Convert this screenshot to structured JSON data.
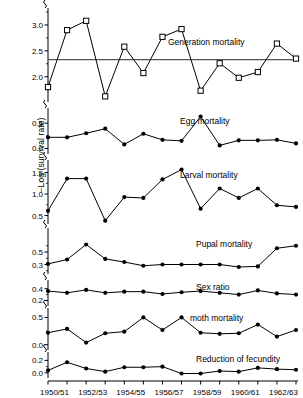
{
  "figure": {
    "y_axis_title": "−Log (survival rate)",
    "x_tick_labels": [
      "1950/51",
      "1952/53",
      "1954/55",
      "1956/57",
      "1958/59",
      "1960/61",
      "1962/63"
    ],
    "x_tick_years": [
      1950,
      1952,
      1954,
      1956,
      1958,
      1960,
      1962
    ],
    "x_range": [
      1950,
      1963
    ],
    "n_points": 14,
    "series_color": "#000000",
    "mean_line_color": "#555555",
    "background_color": "#ffffff"
  },
  "chart_data": [
    {
      "type": "line",
      "title": "Generation mortality",
      "marker": "open-square",
      "xlabel": "",
      "ylabel": "−Log (survival rate)",
      "ylim": [
        1.55,
        3.25
      ],
      "yticks": [
        2.0,
        2.5,
        3.0
      ],
      "ytick_labels": [
        "2.0",
        "2.5",
        "3.0"
      ],
      "mean_line": 2.33,
      "x": [
        1950,
        1951,
        1952,
        1953,
        1954,
        1955,
        1956,
        1957,
        1958,
        1959,
        1960,
        1961,
        1962,
        1963
      ],
      "values": [
        1.8,
        2.9,
        3.08,
        1.62,
        2.58,
        2.07,
        2.77,
        2.92,
        1.73,
        2.26,
        1.98,
        2.09,
        2.64,
        2.35
      ]
    },
    {
      "type": "line",
      "title": "Egg mortality",
      "marker": "filled-circle",
      "xlabel": "",
      "ylabel": "",
      "ylim": [
        -0.07,
        0.72
      ],
      "yticks": [
        0.0,
        0.5
      ],
      "ytick_labels": [
        "0.0",
        "0.5"
      ],
      "x": [
        1950,
        1951,
        1952,
        1953,
        1954,
        1955,
        1956,
        1957,
        1958,
        1959,
        1960,
        1961,
        1962,
        1963
      ],
      "values": [
        0.22,
        0.22,
        0.3,
        0.39,
        0.08,
        0.29,
        0.17,
        0.15,
        0.63,
        0.06,
        0.16,
        0.16,
        0.17,
        0.1
      ]
    },
    {
      "type": "line",
      "title": "Larval mortality",
      "marker": "filled-circle",
      "xlabel": "",
      "ylabel": "",
      "ylim": [
        0.35,
        1.7
      ],
      "yticks": [
        0.5,
        1.0,
        1.5
      ],
      "ytick_labels": [
        "0.5",
        "1.0",
        "1.5"
      ],
      "x": [
        1950,
        1951,
        1952,
        1953,
        1954,
        1955,
        1956,
        1957,
        1958,
        1959,
        1960,
        1961,
        1962,
        1963
      ],
      "values": [
        0.61,
        1.36,
        1.36,
        0.38,
        0.93,
        0.91,
        1.34,
        1.57,
        0.66,
        1.13,
        0.91,
        1.13,
        0.74,
        0.7
      ]
    },
    {
      "type": "line",
      "title": "Pupal mortality",
      "marker": "filled-circle",
      "xlabel": "",
      "ylabel": "",
      "ylim": [
        0.18,
        0.82
      ],
      "yticks": [
        0.3,
        0.5
      ],
      "ytick_labels": [
        "0.3",
        "0.5"
      ],
      "x": [
        1950,
        1951,
        1952,
        1953,
        1954,
        1955,
        1956,
        1957,
        1958,
        1959,
        1960,
        1961,
        1962,
        1963
      ],
      "values": [
        0.31,
        0.38,
        0.62,
        0.39,
        0.34,
        0.28,
        0.3,
        0.3,
        0.3,
        0.3,
        0.26,
        0.27,
        0.56,
        0.6
      ]
    },
    {
      "type": "line",
      "title": "Sex ratio",
      "marker": "filled-circle",
      "xlabel": "",
      "ylabel": "",
      "ylim": [
        0.14,
        0.48
      ],
      "yticks": [
        0.2,
        0.4
      ],
      "ytick_labels": [
        "0.2",
        "0.4"
      ],
      "x": [
        1950,
        1951,
        1952,
        1953,
        1954,
        1955,
        1956,
        1957,
        1958,
        1959,
        1960,
        1961,
        1962,
        1963
      ],
      "values": [
        0.36,
        0.33,
        0.38,
        0.33,
        0.35,
        0.35,
        0.31,
        0.34,
        0.36,
        0.33,
        0.3,
        0.37,
        0.32,
        0.3
      ]
    },
    {
      "type": "line",
      "title": "moth mortality",
      "marker": "filled-circle",
      "xlabel": "",
      "ylabel": "",
      "ylim": [
        -0.06,
        0.6
      ],
      "yticks": [
        0.0,
        0.5
      ],
      "ytick_labels": [
        "0.0",
        "0.5"
      ],
      "x": [
        1950,
        1951,
        1952,
        1953,
        1954,
        1955,
        1956,
        1957,
        1958,
        1959,
        1960,
        1961,
        1962,
        1963
      ],
      "values": [
        0.22,
        0.29,
        0.04,
        0.21,
        0.24,
        0.5,
        0.27,
        0.5,
        0.22,
        0.2,
        0.21,
        0.37,
        0.15,
        0.27
      ]
    },
    {
      "type": "line",
      "title": "Reduction of fecundity",
      "marker": "filled-circle",
      "xlabel": "",
      "ylabel": "",
      "ylim": [
        -0.05,
        0.27
      ],
      "yticks": [
        0.0,
        0.2
      ],
      "ytick_labels": [
        "0.0",
        "0.2"
      ],
      "x": [
        1950,
        1951,
        1952,
        1953,
        1954,
        1955,
        1956,
        1957,
        1958,
        1959,
        1960,
        1961,
        1962,
        1963
      ],
      "values": [
        0.04,
        0.17,
        0.07,
        0.02,
        0.09,
        0.09,
        0.1,
        -0.01,
        -0.01,
        0.03,
        0.02,
        0.08,
        0.06,
        0.05
      ]
    }
  ]
}
